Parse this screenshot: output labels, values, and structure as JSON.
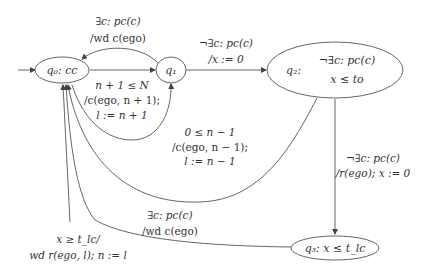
{
  "diagram": {
    "type": "state-machine",
    "states": [
      {
        "id": "q0",
        "label": "q₀: cc"
      },
      {
        "id": "q1",
        "label": "q₁"
      },
      {
        "id": "q2",
        "label": "q₂:",
        "invariant_line1": "¬∃c: pc(c)",
        "invariant_line2": "x ≤ to"
      },
      {
        "id": "q3",
        "label": "q₃: x ≤ t_lc"
      }
    ],
    "transitions": {
      "q1_q0": {
        "line1": "∃c: pc(c)",
        "line2": "/wd c(ego)"
      },
      "q0_q1": {
        "line1": "n + 1 ≤ N",
        "line2": "/c(ego, n + 1);",
        "line3": "l := n + 1"
      },
      "q0_q1_loop": {
        "line1": "0 ≤ n − 1",
        "line2": "/c(ego, n − 1);",
        "line3": "l := n − 1"
      },
      "q1_q2": {
        "line1": "¬∃c: pc(c)",
        "line2": "/x := 0"
      },
      "q2_q3": {
        "line1": "¬∃c: pc(c)",
        "line2": "/r(ego); x := 0"
      },
      "q3_q0_wd": {
        "line1": "∃c: pc(c)",
        "line2": "/wd c(ego)"
      },
      "q3_q0_timeout": {
        "line1": "x ≥ t_lc/",
        "line2": "wd r(ego, l); n := l"
      }
    }
  }
}
